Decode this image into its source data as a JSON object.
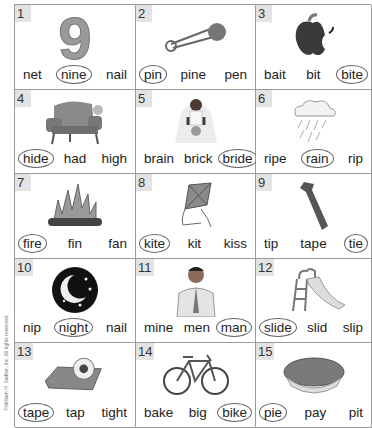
{
  "copyright": "©William H. Sadlier, Inc. All rights reserved.",
  "items": [
    {
      "number": "1",
      "picture": "nine",
      "words": [
        "net",
        "nine",
        "nail"
      ],
      "answer": 1
    },
    {
      "number": "2",
      "picture": "safety-pin",
      "words": [
        "pin",
        "pine",
        "pen"
      ],
      "answer": 0
    },
    {
      "number": "3",
      "picture": "bitten-apple",
      "words": [
        "bait",
        "bit",
        "bite"
      ],
      "answer": 2
    },
    {
      "number": "4",
      "picture": "armchair-hide",
      "words": [
        "hide",
        "had",
        "high"
      ],
      "answer": 0
    },
    {
      "number": "5",
      "picture": "bride",
      "words": [
        "brain",
        "brick",
        "bride"
      ],
      "answer": 2
    },
    {
      "number": "6",
      "picture": "rain-cloud",
      "words": [
        "ripe",
        "rain",
        "rip"
      ],
      "answer": 1
    },
    {
      "number": "7",
      "picture": "fire",
      "words": [
        "fire",
        "fin",
        "fan"
      ],
      "answer": 0
    },
    {
      "number": "8",
      "picture": "kite",
      "words": [
        "kite",
        "kit",
        "kiss"
      ],
      "answer": 0
    },
    {
      "number": "9",
      "picture": "necktie",
      "words": [
        "tip",
        "tape",
        "tie"
      ],
      "answer": 2
    },
    {
      "number": "10",
      "picture": "night-moon",
      "words": [
        "nip",
        "night",
        "nail"
      ],
      "answer": 1
    },
    {
      "number": "11",
      "picture": "man",
      "words": [
        "mine",
        "men",
        "man"
      ],
      "answer": 2
    },
    {
      "number": "12",
      "picture": "slide",
      "words": [
        "slide",
        "slid",
        "slip"
      ],
      "answer": 0
    },
    {
      "number": "13",
      "picture": "tape-dispenser",
      "words": [
        "tape",
        "tap",
        "tight"
      ],
      "answer": 0
    },
    {
      "number": "14",
      "picture": "bicycle",
      "words": [
        "bake",
        "big",
        "bike"
      ],
      "answer": 2
    },
    {
      "number": "15",
      "picture": "pie",
      "words": [
        "pie",
        "pay",
        "pit"
      ],
      "answer": 0
    }
  ]
}
